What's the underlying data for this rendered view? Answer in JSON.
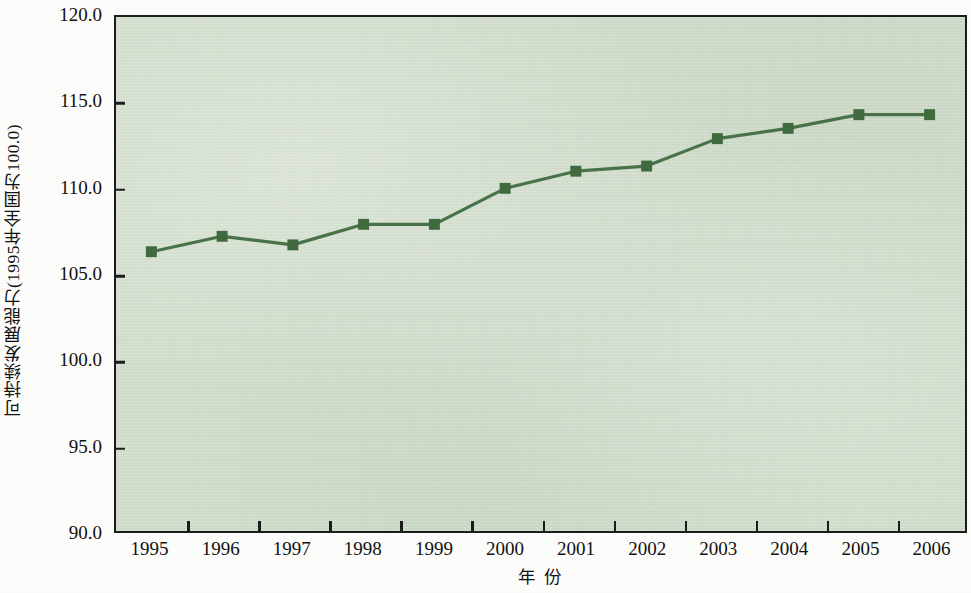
{
  "chart_data": {
    "type": "line",
    "title": "",
    "subtitle": "",
    "xlabel": "年  份",
    "ylabel": "可持续发展能力(1995年全国为100.0)",
    "categories": [
      "1995",
      "1996",
      "1997",
      "1998",
      "1999",
      "2000",
      "2001",
      "2002",
      "2003",
      "2004",
      "2005",
      "2006"
    ],
    "values": [
      106.3,
      107.2,
      106.7,
      107.9,
      107.9,
      110.0,
      111.0,
      111.3,
      112.9,
      113.5,
      114.3,
      114.3
    ],
    "series": [
      {
        "name": "可持续发展能力",
        "values": [
          106.3,
          107.2,
          106.7,
          107.9,
          107.9,
          110.0,
          111.0,
          111.3,
          112.9,
          113.5,
          114.3,
          114.3
        ]
      }
    ],
    "ylim": [
      90.0,
      120.0
    ],
    "yticks": [
      90.0,
      95.0,
      100.0,
      105.0,
      110.0,
      115.0,
      120.0
    ],
    "ytick_labels": [
      "90.0",
      "95.0",
      "100.0",
      "105.0",
      "110.0",
      "115.0",
      "120.0"
    ],
    "grid": false,
    "legend": "none",
    "line_color": "#4a7249",
    "marker_color": "#3f6b3e",
    "marker_shape": "square",
    "plot_background": "#cfdcc9",
    "axis_color": "#1c1c1c"
  }
}
